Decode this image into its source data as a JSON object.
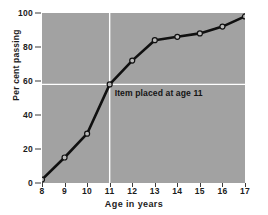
{
  "chart_data": {
    "type": "line",
    "title": "",
    "xlabel": "Age in years",
    "ylabel": "Per cent passing",
    "x": [
      8,
      9,
      10,
      11,
      12,
      13,
      14,
      15,
      16,
      17
    ],
    "values": [
      2,
      15,
      29,
      58,
      72,
      84,
      86,
      88,
      92,
      98
    ],
    "series": [
      {
        "name": "Per cent passing",
        "values": [
          2,
          15,
          29,
          58,
          72,
          84,
          86,
          88,
          92,
          98
        ]
      }
    ],
    "xlim": [
      8,
      17
    ],
    "ylim": [
      0,
      100
    ],
    "xticks": [
      "8",
      "9",
      "10",
      "11",
      "12",
      "13",
      "14",
      "15",
      "16",
      "17"
    ],
    "yticks": [
      "0",
      "20",
      "40",
      "60",
      "80",
      "100"
    ],
    "grid": false,
    "legend": "none",
    "annotations": [
      {
        "text": "Item placed at age 11",
        "x": 11,
        "y": 58
      }
    ],
    "reference_lines": [
      {
        "orientation": "vertical",
        "value": 11
      },
      {
        "orientation": "horizontal",
        "value": 58
      }
    ],
    "colors": {
      "plot_background": "#a2a2a2",
      "line": "#101010",
      "marker_face": "#b9b9b9",
      "marker_edge": "#101010",
      "reference_line": "#ffffff",
      "text": "#1c1c1c",
      "page_background": "#ffffff"
    }
  }
}
